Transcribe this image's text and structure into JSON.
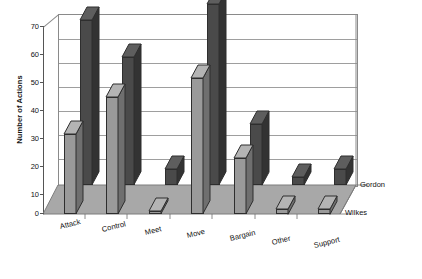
{
  "chart_data": {
    "type": "bar",
    "title": "",
    "xlabel": "",
    "ylabel": "Number of Actions",
    "ylim": [
      0,
      70
    ],
    "ytick_labels": [
      "0",
      "10",
      "20",
      "30",
      "40",
      "50",
      "60",
      "70"
    ],
    "ytick_values": [
      0,
      10,
      20,
      30,
      40,
      50,
      60,
      70
    ],
    "grid": true,
    "projection": "3d",
    "legend_position": "right-depth-axis",
    "categories": [
      "Attack",
      "Control",
      "Meet",
      "Move",
      "Bargain",
      "Other",
      "Support"
    ],
    "series": [
      {
        "name": "Gordon",
        "color": "#4a4a4a",
        "values": [
          62,
          48,
          6,
          68,
          23,
          3,
          6
        ]
      },
      {
        "name": "Wilkes",
        "color": "#9a9a9a",
        "values": [
          30,
          44,
          1,
          51,
          21,
          2,
          2
        ]
      }
    ]
  },
  "colors": {
    "series_gordon": "#4a4a4a",
    "series_gordon_side": "#333333",
    "series_gordon_top": "#5e5e5e",
    "series_wilkes": "#9a9a9a",
    "series_wilkes_side": "#6f6f6f",
    "series_wilkes_top": "#b4b4b4",
    "floor": "#a8a8a8",
    "wall": "#ffffff",
    "grid": "#9e9e9e",
    "axis": "#555555",
    "text": "#111111"
  }
}
